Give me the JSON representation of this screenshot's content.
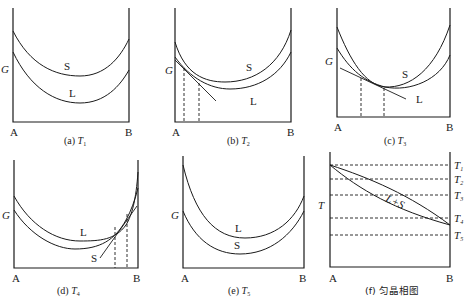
{
  "figure": {
    "axis_labels": {
      "y_energy": "G",
      "y_temperature": "T",
      "x_left": "A",
      "x_right": "B"
    },
    "panels": [
      {
        "id": "a",
        "caption_prefix": "(a) ",
        "caption_var": "T",
        "caption_sub": "1",
        "curve_labels": {
          "upper": "S",
          "lower": "L"
        }
      },
      {
        "id": "b",
        "caption_prefix": "(b) ",
        "caption_var": "T",
        "caption_sub": "2",
        "curve_labels": {
          "upper": "S",
          "lower": "L"
        }
      },
      {
        "id": "c",
        "caption_prefix": "(c) ",
        "caption_var": "T",
        "caption_sub": "3",
        "curve_labels": {
          "upper": "S",
          "lower": "L"
        }
      },
      {
        "id": "d",
        "caption_prefix": "(d) ",
        "caption_var": "T",
        "caption_sub": "4",
        "curve_labels": {
          "upper": "L",
          "lower": "S"
        }
      },
      {
        "id": "e",
        "caption_prefix": "(e) ",
        "caption_var": "T",
        "caption_sub": "5",
        "curve_labels": {
          "upper": "L",
          "lower": "S"
        }
      },
      {
        "id": "f",
        "caption": "(f) 匀晶相图",
        "region_label": "L+S",
        "temperature_lines": [
          {
            "var": "T",
            "sub": "1"
          },
          {
            "var": "T",
            "sub": "2"
          },
          {
            "var": "T",
            "sub": "3"
          },
          {
            "var": "T",
            "sub": "4"
          },
          {
            "var": "T",
            "sub": "5"
          }
        ]
      }
    ]
  }
}
